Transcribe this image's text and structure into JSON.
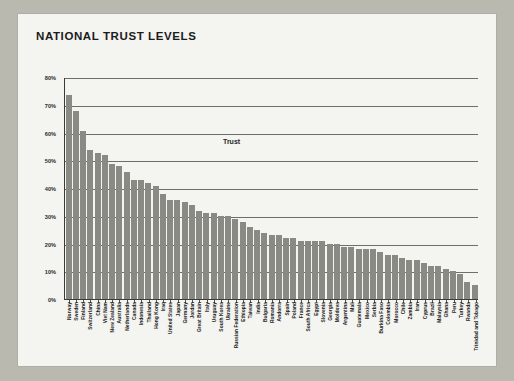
{
  "card": {
    "title": "NATIONAL TRUST LEVELS"
  },
  "chart_data": {
    "type": "bar",
    "title": "NATIONAL TRUST LEVELS",
    "xlabel": "",
    "ylabel": "",
    "ylim": [
      0,
      80
    ],
    "yticks": [
      "0%",
      "10%",
      "20%",
      "30%",
      "40%",
      "50%",
      "60%",
      "70%",
      "80%"
    ],
    "grid": true,
    "legend_position": "inside-plot",
    "annotations": [
      "Trust"
    ],
    "series_name": "Trust",
    "bar_color": "#8a8a85",
    "categories": [
      "Norway",
      "Sweden",
      "Finland",
      "Switzerland",
      "China",
      "Viet Nam",
      "New Zealand",
      "Australia",
      "Netherlands",
      "Canada",
      "Indonesia",
      "Thailand",
      "Hong Kong",
      "Iraq",
      "United States",
      "Japan",
      "Germany",
      "Jordan",
      "Great Britain",
      "Italy",
      "Uruguay",
      "South Korea",
      "Ukraine",
      "Russian Federation",
      "Ethiopia",
      "Taiwan",
      "India",
      "Bulgaria",
      "Romania",
      "Andorra",
      "Spain",
      "Poland",
      "France",
      "South Africa",
      "Egypt",
      "Slovenia",
      "Georgia",
      "Moldova",
      "Argentina",
      "Mali",
      "Guatemala",
      "Mexico",
      "Serbia",
      "Burkina Faso",
      "Colombia",
      "Morocco",
      "Chile",
      "Zambia",
      "Iran",
      "Cyprus",
      "Brazil",
      "Malaysia",
      "Ghana",
      "Peru",
      "Turkey",
      "Rwanda",
      "Trinidad and Tobago"
    ],
    "values": [
      74,
      68,
      61,
      54,
      53,
      52,
      49,
      48,
      46,
      43,
      43,
      42,
      41,
      38,
      36,
      36,
      35,
      34,
      32,
      31,
      31,
      30,
      30,
      29,
      28,
      26,
      25,
      24,
      23,
      23,
      22,
      22,
      21,
      21,
      21,
      21,
      20,
      20,
      19,
      19,
      18,
      18,
      18,
      17,
      16,
      16,
      15,
      14,
      14,
      13,
      12,
      12,
      11,
      10,
      9,
      6,
      5
    ]
  }
}
